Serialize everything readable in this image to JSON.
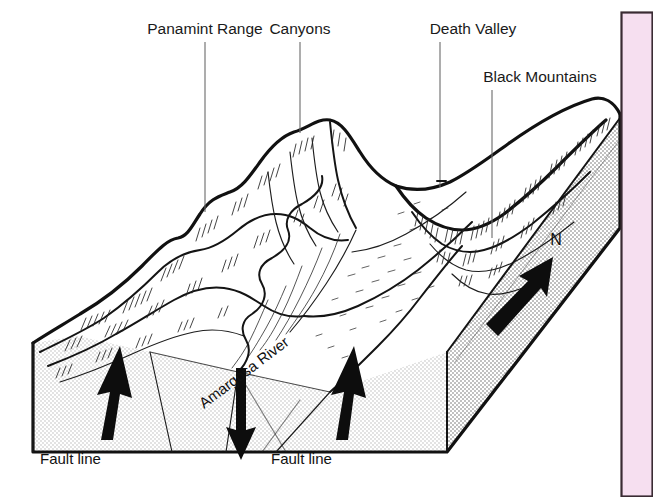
{
  "figure": {
    "type": "geologic-block-diagram",
    "labels": {
      "panamint_range": "Panamint Range",
      "canyons": "Canyons",
      "death_valley": "Death Valley",
      "black_mountains": "Black Mountains",
      "amargosa_river": "Amargosa River",
      "fault_line_left": "Fault line",
      "fault_line_right": "Fault line",
      "north": "N"
    },
    "annotations": {
      "uplift_left": "upward-arrow",
      "uplift_right": "upward-arrow",
      "downdrop_center": "downward-arrow",
      "north_arrow": "north-arrow"
    },
    "colors": {
      "ink": "#111111",
      "block_face": "#e9e9e9",
      "leader_line": "#6a6a6a",
      "panel_fill": "#f6dff0",
      "panel_border": "#3a2b33",
      "page_background": "#ffffff"
    }
  },
  "side_panel": {
    "name": "pink-side-panel",
    "fill": "#f6dff0",
    "border": "#3a2b33"
  }
}
